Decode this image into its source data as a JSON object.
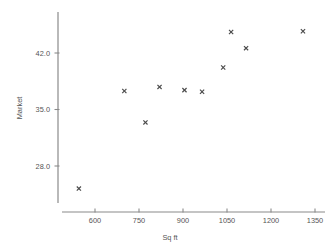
{
  "chart_data": {
    "type": "scatter",
    "title": "",
    "xlabel": "Sq ft",
    "ylabel": "Market",
    "xlim": [
      500,
      1390
    ],
    "ylim": [
      23.0,
      46.5
    ],
    "grid": false,
    "legend": "none",
    "marker": "x",
    "marker_color": "#4a4a4a",
    "axis_color": "#808080",
    "xticks": [
      600,
      750,
      900,
      1050,
      1200,
      1350
    ],
    "xtick_labels": [
      "600",
      "750",
      "900",
      "1050",
      "1200",
      "1350"
    ],
    "yticks": [
      28.0,
      35.0,
      42.0
    ],
    "ytick_labels": [
      "28.0",
      "35.0",
      "42.0"
    ],
    "points": [
      {
        "x": 545,
        "y": 25.2
      },
      {
        "x": 700,
        "y": 37.3
      },
      {
        "x": 772,
        "y": 33.4
      },
      {
        "x": 820,
        "y": 37.8
      },
      {
        "x": 905,
        "y": 37.4
      },
      {
        "x": 965,
        "y": 37.2
      },
      {
        "x": 1037,
        "y": 40.2
      },
      {
        "x": 1064,
        "y": 44.6
      },
      {
        "x": 1115,
        "y": 42.6
      },
      {
        "x": 1309,
        "y": 44.7
      }
    ],
    "series": [
      {
        "name": "Market vs Sq ft",
        "x": [
          545,
          700,
          772,
          820,
          905,
          965,
          1037,
          1064,
          1115,
          1309
        ],
        "values": [
          25.2,
          37.3,
          33.4,
          37.8,
          37.4,
          37.2,
          40.2,
          44.6,
          42.6,
          44.7
        ]
      }
    ]
  }
}
